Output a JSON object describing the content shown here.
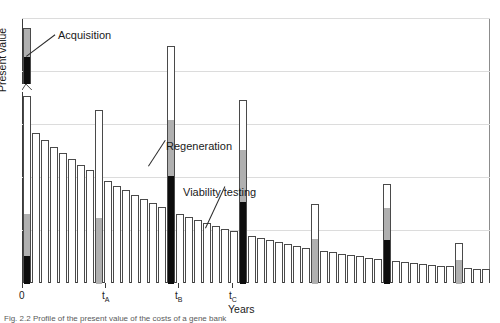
{
  "figure": {
    "ylabel": "Present value",
    "xlabel": "Years",
    "caption": "Fig. 2.2  Profile of the present value of the costs of a gene bank"
  },
  "annotations": [
    {
      "name": "acquisition",
      "label": "Acquisition",
      "x": 58,
      "y": 29,
      "lx": 26,
      "ly": 56,
      "len": 36,
      "ang": -37
    },
    {
      "name": "regeneration",
      "label": "Regeneration",
      "x": 166,
      "y": 140,
      "lx": 148,
      "ly": 166,
      "len": 31,
      "ang": -57
    },
    {
      "name": "viability-testing",
      "label": "Viability testing",
      "x": 183,
      "y": 186,
      "lx": 205,
      "ly": 228,
      "len": 46,
      "ang": -65
    }
  ],
  "xticks": [
    {
      "label": "0",
      "sub": "",
      "x": 22
    },
    {
      "label": "t",
      "sub": "A",
      "x": 105
    },
    {
      "label": "t",
      "sub": "B",
      "x": 178
    },
    {
      "label": "t",
      "sub": "C",
      "x": 232
    }
  ],
  "colors": {
    "maintenance": "#ffffff",
    "viability": "#b0b0b0",
    "regeneration": "#0d0d0d",
    "outline": "#4a4a4a",
    "grid": "#dcdcdc"
  },
  "chart_data": {
    "type": "bar",
    "title": "",
    "xlabel": "Years",
    "ylabel": "Present value",
    "grid": true,
    "legend": "none",
    "xlim": [
      0,
      52
    ],
    "ylim": [
      0,
      265
    ],
    "gridlines": [
      53,
      106,
      159,
      212,
      265
    ],
    "axis_break": {
      "bar_index": 0,
      "note": "Acquisition bar is drawn with a broken y-axis; upper fragment sits above the break at y=78.",
      "break_y": 78
    },
    "categories": [
      0,
      1,
      2,
      3,
      4,
      5,
      6,
      7,
      8,
      9,
      10,
      11,
      12,
      13,
      14,
      15,
      16,
      17,
      18,
      19,
      20,
      21,
      22,
      23,
      24,
      25,
      26,
      27,
      28,
      29,
      30,
      31,
      32,
      33,
      34,
      35,
      36,
      37,
      38,
      39,
      40,
      41,
      42,
      43,
      44,
      45,
      46,
      47,
      48,
      49,
      50,
      51
    ],
    "series": [
      {
        "name": "Maintenance",
        "color": "#ffffff",
        "values": [
          188,
          150,
          143,
          136,
          130,
          124,
          118,
          113,
          107,
          102,
          97,
          93,
          88,
          84,
          80,
          76,
          73,
          69,
          66,
          63,
          60,
          57,
          54,
          52,
          49,
          47,
          45,
          43,
          41,
          39,
          37,
          35,
          34,
          32,
          31,
          29,
          28,
          27,
          25,
          24,
          23,
          22,
          21,
          20,
          19,
          18,
          17,
          17,
          16,
          15,
          14,
          14
        ]
      },
      {
        "name": "Viability testing",
        "color": "#b0b0b0",
        "stacked_on": "Maintenance",
        "values": [
          42,
          0,
          0,
          0,
          0,
          0,
          0,
          0,
          66,
          0,
          0,
          0,
          0,
          0,
          0,
          0,
          56,
          0,
          0,
          0,
          0,
          0,
          0,
          0,
          52,
          0,
          0,
          0,
          0,
          0,
          0,
          0,
          45,
          0,
          0,
          0,
          0,
          0,
          0,
          0,
          32,
          0,
          0,
          0,
          0,
          0,
          0,
          0,
          24,
          0,
          0,
          0
        ]
      },
      {
        "name": "Regeneration",
        "color": "#0d0d0d",
        "stacked_on": "Viability testing",
        "values": [
          28,
          0,
          0,
          0,
          0,
          0,
          0,
          0,
          0,
          0,
          0,
          0,
          0,
          0,
          0,
          0,
          108,
          0,
          0,
          0,
          0,
          0,
          0,
          0,
          82,
          0,
          0,
          0,
          0,
          0,
          0,
          0,
          0,
          0,
          0,
          0,
          0,
          0,
          0,
          0,
          44,
          0,
          0,
          0,
          0,
          0,
          0,
          0,
          0,
          0,
          0,
          0
        ]
      }
    ]
  }
}
